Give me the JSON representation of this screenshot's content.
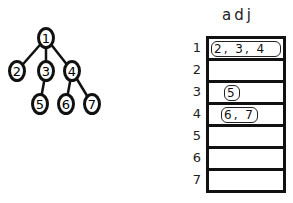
{
  "tree": {
    "nodes": [
      {
        "id": "1",
        "x": 46,
        "y": 38
      },
      {
        "id": "2",
        "x": 17,
        "y": 71
      },
      {
        "id": "3",
        "x": 46,
        "y": 71
      },
      {
        "id": "4",
        "x": 72,
        "y": 71
      },
      {
        "id": "5",
        "x": 40,
        "y": 104
      },
      {
        "id": "6",
        "x": 66,
        "y": 104
      },
      {
        "id": "7",
        "x": 92,
        "y": 104
      }
    ],
    "edges": [
      [
        "1",
        "2"
      ],
      [
        "1",
        "3"
      ],
      [
        "1",
        "4"
      ],
      [
        "3",
        "5"
      ],
      [
        "4",
        "6"
      ],
      [
        "4",
        "7"
      ]
    ]
  },
  "adj": {
    "title": "adj",
    "rows": [
      {
        "label": "1",
        "value": "2, 3, 4"
      },
      {
        "label": "2",
        "value": ""
      },
      {
        "label": "3",
        "value": "5"
      },
      {
        "label": "4",
        "value": "6, 7"
      },
      {
        "label": "5",
        "value": ""
      },
      {
        "label": "6",
        "value": ""
      },
      {
        "label": "7",
        "value": ""
      }
    ]
  }
}
